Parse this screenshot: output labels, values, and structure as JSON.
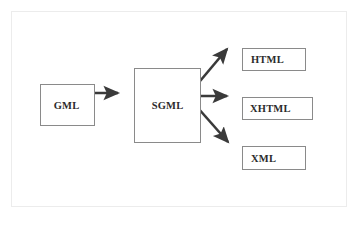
{
  "figure": {
    "title": "",
    "frame_color": "#d8d8d8",
    "background": "#ffffff"
  },
  "diagram": {
    "type": "flowchart",
    "node_border_color": "#8a8a8a",
    "arrow_color": "#3a3a3a",
    "nodes": [
      {
        "id": "gml",
        "label": "GML"
      },
      {
        "id": "sgml",
        "label": "SGML"
      },
      {
        "id": "html",
        "label": "HTML"
      },
      {
        "id": "xhtml",
        "label": "XHTML"
      },
      {
        "id": "xml",
        "label": "XML"
      }
    ],
    "edges": [
      {
        "from": "GML",
        "to": "SGML",
        "style": "arrow",
        "direction": "horizontal"
      },
      {
        "from": "SGML",
        "to": "HTML",
        "style": "arrow",
        "direction": "diagonal-up"
      },
      {
        "from": "SGML",
        "to": "XHTML",
        "style": "arrow",
        "direction": "horizontal"
      },
      {
        "from": "SGML",
        "to": "XML",
        "style": "arrow",
        "direction": "diagonal-down"
      }
    ]
  }
}
